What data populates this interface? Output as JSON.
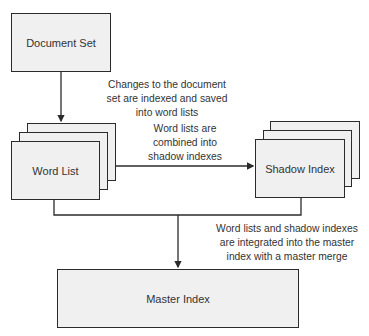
{
  "nodes": {
    "document_set": "Document Set",
    "word_list": "Word List",
    "shadow_index": "Shadow Index",
    "master_index": "Master Index"
  },
  "annotations": {
    "doc_to_wordlist": [
      "Changes to the document",
      "set are indexed and saved",
      "into word lists"
    ],
    "wordlist_to_shadow": [
      "Word lists are",
      "combined into",
      "shadow indexes"
    ],
    "to_master": [
      "Word lists and shadow indexes",
      "are integrated into the master",
      "index with a master merge"
    ]
  },
  "colors": {
    "box_fill": "#f0f0f0",
    "stroke": "#2b2b2b",
    "text": "#333333"
  }
}
